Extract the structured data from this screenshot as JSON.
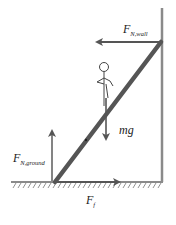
{
  "diagram": {
    "colors": {
      "wall": "#8a8a8a",
      "ladder": "#555555",
      "arrow": "#666666",
      "figure": "#444444",
      "text": "#222222"
    },
    "labels": {
      "normal_wall": {
        "main": "F",
        "sub": "N,wall"
      },
      "normal_ground": {
        "main": "F",
        "sub": "N,ground"
      },
      "weight": {
        "main": "mg"
      },
      "friction": {
        "main": "F",
        "sub": "f"
      }
    },
    "elements": [
      "wall",
      "ground",
      "ladder",
      "person",
      "arrow-normal-wall",
      "arrow-normal-ground",
      "arrow-weight",
      "arrow-friction"
    ]
  }
}
